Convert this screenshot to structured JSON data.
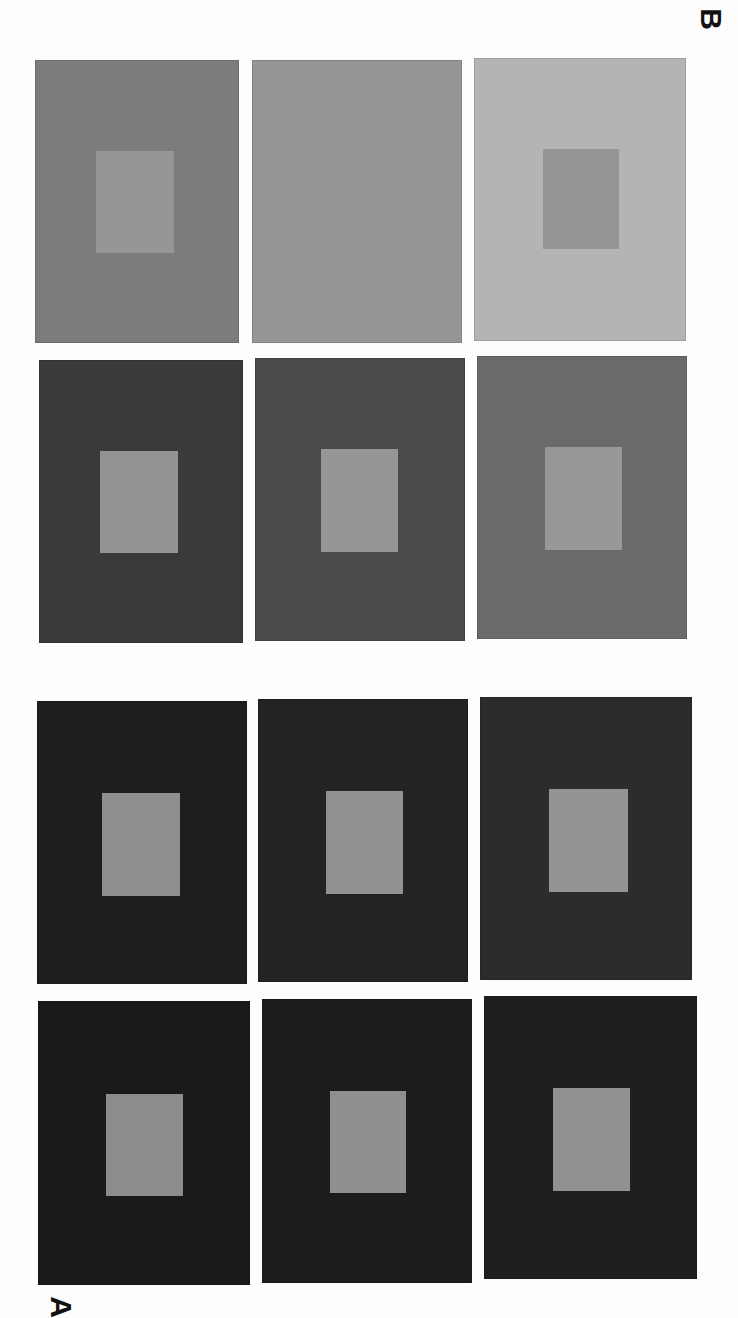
{
  "figure": {
    "title": "",
    "labels": [
      {
        "id": "B",
        "text": "B"
      },
      {
        "id": "A",
        "text": "A"
      }
    ],
    "groups": [
      {
        "label": "B",
        "panels": [
          {
            "row": 0,
            "col": 0,
            "surround": "#7c7c7c",
            "patch": "#969696",
            "x": 35,
            "y": 60,
            "w": 204,
            "h": 283,
            "px": 60,
            "py": 90,
            "pw": 78,
            "ph": 102
          },
          {
            "row": 0,
            "col": 1,
            "surround": "#969696",
            "patch": "#969696",
            "x": 252,
            "y": 60,
            "w": 210,
            "h": 283,
            "px": 70,
            "py": 90,
            "pw": 78,
            "ph": 102
          },
          {
            "row": 0,
            "col": 2,
            "surround": "#b4b4b4",
            "patch": "#959595",
            "x": 474,
            "y": 58,
            "w": 212,
            "h": 283,
            "px": 68,
            "py": 90,
            "pw": 76,
            "ph": 100
          },
          {
            "row": 1,
            "col": 0,
            "surround": "#3a3a3a",
            "patch": "#939393",
            "x": 39,
            "y": 360,
            "w": 204,
            "h": 283,
            "px": 60,
            "py": 90,
            "pw": 78,
            "ph": 102
          },
          {
            "row": 1,
            "col": 1,
            "surround": "#4a4a4a",
            "patch": "#969696",
            "x": 255,
            "y": 358,
            "w": 210,
            "h": 283,
            "px": 65,
            "py": 90,
            "pw": 77,
            "ph": 103
          },
          {
            "row": 1,
            "col": 2,
            "surround": "#6a6a6a",
            "patch": "#979797",
            "x": 477,
            "y": 356,
            "w": 210,
            "h": 283,
            "px": 67,
            "py": 90,
            "pw": 77,
            "ph": 103
          }
        ]
      },
      {
        "label": "A",
        "panels": [
          {
            "row": 0,
            "col": 0,
            "surround": "#1e1e1e",
            "patch": "#8f8f8f",
            "x": 37,
            "y": 701,
            "w": 210,
            "h": 283,
            "px": 64,
            "py": 91,
            "pw": 78,
            "ph": 103
          },
          {
            "row": 0,
            "col": 1,
            "surround": "#232323",
            "patch": "#919191",
            "x": 258,
            "y": 699,
            "w": 210,
            "h": 283,
            "px": 67,
            "py": 91,
            "pw": 77,
            "ph": 103
          },
          {
            "row": 0,
            "col": 2,
            "surround": "#2c2c2c",
            "patch": "#939393",
            "x": 480,
            "y": 697,
            "w": 212,
            "h": 283,
            "px": 68,
            "py": 91,
            "pw": 79,
            "ph": 103
          },
          {
            "row": 1,
            "col": 0,
            "surround": "#1a1a1a",
            "patch": "#8c8c8c",
            "x": 38,
            "y": 1001,
            "w": 212,
            "h": 284,
            "px": 67,
            "py": 92,
            "pw": 77,
            "ph": 102
          },
          {
            "row": 1,
            "col": 1,
            "surround": "#1c1c1c",
            "patch": "#8f8f8f",
            "x": 262,
            "y": 999,
            "w": 210,
            "h": 284,
            "px": 67,
            "py": 91,
            "pw": 76,
            "ph": 102
          },
          {
            "row": 1,
            "col": 2,
            "surround": "#1f1f1f",
            "patch": "#919191",
            "x": 484,
            "y": 996,
            "w": 213,
            "h": 283,
            "px": 68,
            "py": 91,
            "pw": 77,
            "ph": 103
          }
        ]
      }
    ]
  },
  "colors": {
    "background": "#fdfdfd",
    "label": "#111111"
  }
}
